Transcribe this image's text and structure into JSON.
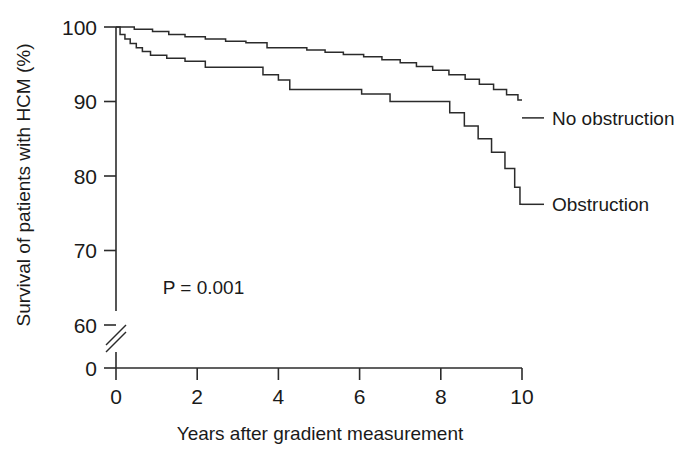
{
  "figure": {
    "kind": "kaplan-meier-survival-plot",
    "background_color": "#ffffff",
    "line_color": "#2b2b2b"
  },
  "axes": {
    "y_title": "Survival of patients with HCM (%)",
    "x_title": "Years after gradient measurement",
    "y_ticks": [
      "100",
      "90",
      "80",
      "70",
      "60",
      "0"
    ],
    "x_ticks": [
      "0",
      "2",
      "4",
      "6",
      "8",
      "10"
    ],
    "y_axis_break": "//",
    "grid": "off"
  },
  "annotations": {
    "p_value": "P = 0.001"
  },
  "series_labels": {
    "no_obstruction": "No obstruction",
    "obstruction": "Obstruction"
  },
  "chart_data": {
    "type": "line",
    "subtype": "kaplan-meier-step",
    "title": "",
    "xlabel": "Years after gradient measurement",
    "ylabel": "Survival of patients with HCM (%)",
    "xlim": [
      0,
      10
    ],
    "ylim": [
      60,
      100
    ],
    "y_axis_break_below": 60,
    "y_ticks": [
      100,
      90,
      80,
      70,
      60,
      0
    ],
    "x_ticks": [
      0,
      2,
      4,
      6,
      8,
      10
    ],
    "grid": false,
    "legend_position": "inline-right-of-curve-end",
    "annotations": [
      {
        "text": "P = 0.001",
        "x": 1.15,
        "y": 63.8
      }
    ],
    "series": [
      {
        "name": "No obstruction",
        "label_x": 10.35,
        "label_y": 87.8,
        "final_value": 87.8,
        "points": [
          [
            0.0,
            100.0
          ],
          [
            0.3,
            100.0
          ],
          [
            0.45,
            99.7
          ],
          [
            0.75,
            99.7
          ],
          [
            0.9,
            99.4
          ],
          [
            1.15,
            99.4
          ],
          [
            1.3,
            99.0
          ],
          [
            1.55,
            99.0
          ],
          [
            1.7,
            98.7
          ],
          [
            2.05,
            98.7
          ],
          [
            2.2,
            98.4
          ],
          [
            2.55,
            98.4
          ],
          [
            2.7,
            98.1
          ],
          [
            3.05,
            98.1
          ],
          [
            3.2,
            97.9
          ],
          [
            3.6,
            97.9
          ],
          [
            3.72,
            97.2
          ],
          [
            4.55,
            97.2
          ],
          [
            4.7,
            96.9
          ],
          [
            5.0,
            96.9
          ],
          [
            5.15,
            96.6
          ],
          [
            5.45,
            96.6
          ],
          [
            5.6,
            96.3
          ],
          [
            5.95,
            96.3
          ],
          [
            6.1,
            96.0
          ],
          [
            6.4,
            96.0
          ],
          [
            6.55,
            95.6
          ],
          [
            6.85,
            95.6
          ],
          [
            7.0,
            95.2
          ],
          [
            7.25,
            95.2
          ],
          [
            7.4,
            94.7
          ],
          [
            7.65,
            94.7
          ],
          [
            7.8,
            94.2
          ],
          [
            8.05,
            94.2
          ],
          [
            8.2,
            93.6
          ],
          [
            8.45,
            93.6
          ],
          [
            8.6,
            93.0
          ],
          [
            8.8,
            93.0
          ],
          [
            8.95,
            92.3
          ],
          [
            9.15,
            92.3
          ],
          [
            9.3,
            91.6
          ],
          [
            9.5,
            91.6
          ],
          [
            9.62,
            90.9
          ],
          [
            9.8,
            90.9
          ],
          [
            9.9,
            90.2
          ],
          [
            10.0,
            90.2
          ]
        ]
      },
      {
        "name": "Obstruction",
        "label_x": 10.35,
        "label_y": 76.2,
        "final_value": 76.2,
        "points": [
          [
            0.0,
            100.0
          ],
          [
            0.1,
            99.0
          ],
          [
            0.22,
            98.4
          ],
          [
            0.35,
            97.8
          ],
          [
            0.5,
            97.2
          ],
          [
            0.65,
            96.7
          ],
          [
            0.85,
            96.2
          ],
          [
            1.1,
            96.2
          ],
          [
            1.25,
            95.8
          ],
          [
            1.55,
            95.8
          ],
          [
            1.7,
            95.4
          ],
          [
            2.05,
            95.4
          ],
          [
            2.2,
            94.6
          ],
          [
            3.5,
            94.6
          ],
          [
            3.62,
            93.6
          ],
          [
            3.85,
            93.6
          ],
          [
            4.0,
            92.9
          ],
          [
            4.15,
            92.9
          ],
          [
            4.28,
            91.6
          ],
          [
            5.9,
            91.6
          ],
          [
            6.05,
            91.0
          ],
          [
            6.6,
            91.0
          ],
          [
            6.75,
            90.0
          ],
          [
            8.1,
            90.0
          ],
          [
            8.22,
            88.5
          ],
          [
            8.45,
            88.5
          ],
          [
            8.58,
            86.7
          ],
          [
            8.8,
            86.7
          ],
          [
            8.92,
            85.0
          ],
          [
            9.12,
            85.0
          ],
          [
            9.25,
            83.2
          ],
          [
            9.45,
            83.2
          ],
          [
            9.58,
            81.0
          ],
          [
            9.72,
            81.0
          ],
          [
            9.82,
            78.5
          ],
          [
            9.9,
            78.5
          ],
          [
            9.95,
            76.2
          ],
          [
            10.0,
            76.2
          ]
        ]
      }
    ]
  }
}
